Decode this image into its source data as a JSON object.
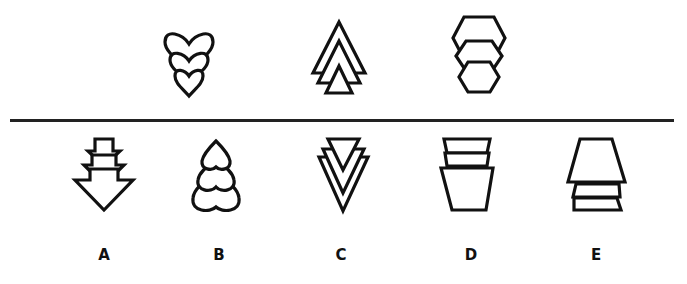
{
  "question_sequence": {
    "figures": [
      {
        "id": "seq-1",
        "description": "three hearts stacked, decreasing in size downward"
      },
      {
        "id": "seq-2",
        "description": "three triangles stacked, decreasing in size downward"
      },
      {
        "id": "seq-3",
        "description": "three hexagons stacked, decreasing in size downward"
      }
    ]
  },
  "answer_options": [
    {
      "label": "A",
      "description": "three downward arrows, increasing in size downward"
    },
    {
      "label": "B",
      "description": "three inverted hearts, increasing in size downward"
    },
    {
      "label": "C",
      "description": "three inverted triangles, nested, increasing in size toward front"
    },
    {
      "label": "D",
      "description": "three trapezoids, increasing in size downward"
    },
    {
      "label": "E",
      "description": "three trapezoids, decreasing in size downward"
    }
  ],
  "colors": {
    "stroke": "#111111",
    "background": "#ffffff",
    "divider": "#222222"
  }
}
